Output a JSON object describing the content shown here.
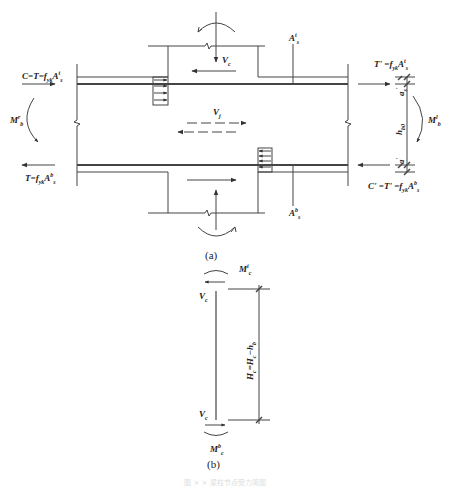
{
  "figure": {
    "part_a": {
      "caption": "(a)",
      "labels": {
        "top_left_force": "C=T=f",
        "top_left_force_sub": "yk",
        "top_left_force_area": "A",
        "top_left_force_area_sup": "t",
        "top_left_force_area_sub": "s",
        "bottom_left_force": "T=f",
        "bottom_left_force_sub": "yk",
        "bottom_left_force_area": "A",
        "bottom_left_force_area_sup": "b",
        "bottom_left_force_area_sub": "s",
        "top_right_force": "T' =f",
        "top_right_force_sub": "yk",
        "top_right_force_area": "A",
        "top_right_force_area_sup": "t",
        "top_right_force_area_sub": "s",
        "bottom_right_force": "C' =T' =f",
        "bottom_right_force_sub": "yk",
        "bottom_right_force_area": "A",
        "bottom_right_force_area_sup": "b",
        "bottom_right_force_area_sub": "s",
        "left_moment": "M",
        "left_moment_sub": "b",
        "left_moment_sup": "r",
        "right_moment": "M",
        "right_moment_sub": "b",
        "right_moment_sup": "l",
        "column_shear": "V",
        "column_shear_sub": "c",
        "joint_shear": "V",
        "joint_shear_sub": "j",
        "top_rebar": "A",
        "top_rebar_sup": "t",
        "top_rebar_sub": "s",
        "bottom_rebar": "A",
        "bottom_rebar_sup": "b",
        "bottom_rebar_sub": "s",
        "effective_depth": "h",
        "effective_depth_sub": "b0",
        "cover_top": "a",
        "cover_top_sub": "s",
        "cover_top_sup": "'",
        "cover_bottom": "a",
        "cover_bottom_sup": "'"
      }
    },
    "part_b": {
      "caption": "(b)",
      "labels": {
        "top_moment": "M",
        "top_moment_sub": "c",
        "top_moment_sup": "t",
        "bottom_moment": "M",
        "bottom_moment_sub": "c",
        "bottom_moment_sup": "b",
        "top_shear": "V",
        "top_shear_sub": "c",
        "bottom_shear": "V",
        "bottom_shear_sub": "c",
        "height": "H",
        "height_sub": "c",
        "height_eq": "=H",
        "height_eq_sub": "c",
        "height_minus": "−h",
        "height_minus_sub": "b"
      }
    },
    "figure_caption": "图 × × 梁柱节点受力简图"
  }
}
